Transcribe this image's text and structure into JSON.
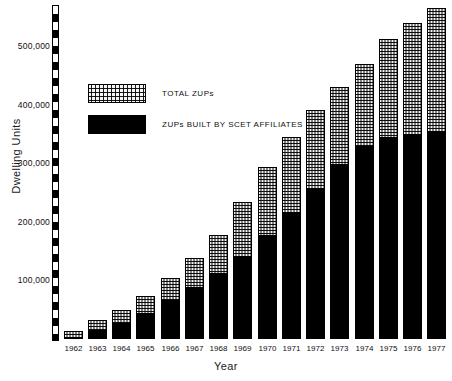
{
  "chart_data": {
    "type": "bar",
    "stacked": true,
    "title": "",
    "xlabel": "Year",
    "ylabel": "Dwelling  Units",
    "categories": [
      "1962",
      "1963",
      "1964",
      "1965",
      "1966",
      "1967",
      "1968",
      "1969",
      "1970",
      "1971",
      "1972",
      "1973",
      "1974",
      "1975",
      "1976",
      "1977"
    ],
    "ylim": [
      0,
      570000
    ],
    "ytick_labels": [
      "100,000",
      "200,000",
      "300,000",
      "400,000",
      "500,000"
    ],
    "yticks": [
      100000,
      200000,
      300000,
      400000,
      500000
    ],
    "grid": false,
    "legend_position": "upper-left-inside",
    "series": [
      {
        "name": "ZUPs BUILT BY SCET AFFILIATES",
        "fill": "solid-black",
        "color": "#000000",
        "values": [
          4000,
          16000,
          27000,
          45000,
          67000,
          88000,
          113000,
          141000,
          177000,
          216000,
          258000,
          298000,
          330000,
          345000,
          350000,
          355000
        ]
      },
      {
        "name": "TOTAL ZUPs",
        "fill": "dotted-checker",
        "color": "#f2f2f2",
        "values": [
          14000,
          32000,
          50000,
          73000,
          104000,
          138000,
          178000,
          233000,
          293000,
          345000,
          390000,
          430000,
          470000,
          512000,
          540000,
          565000
        ]
      }
    ]
  },
  "legend": {
    "items": [
      {
        "label": "TOTAL ZUPs",
        "swatch": "dotted-swatch"
      },
      {
        "label": "ZUPs BUILT BY SCET AFFILIATES",
        "swatch": "black-swatch"
      }
    ]
  },
  "axes": {
    "y_title": "Dwelling  Units",
    "x_title": "Year"
  }
}
